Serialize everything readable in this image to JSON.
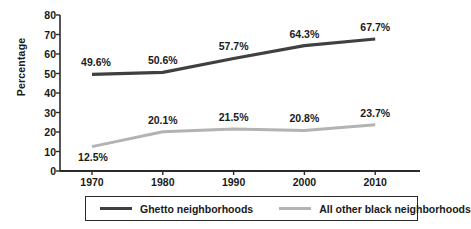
{
  "chart_data": {
    "type": "line",
    "title": "",
    "xlabel": "",
    "ylabel": "Percentage",
    "categories": [
      "1970",
      "1980",
      "1990",
      "2000",
      "2010"
    ],
    "ylim": [
      0,
      80
    ],
    "yticks": [
      "0",
      "10",
      "20",
      "30",
      "40",
      "50",
      "60",
      "70",
      "80"
    ],
    "grid": false,
    "legend_position": "bottom",
    "series": [
      {
        "name": "Ghetto neighborhoods",
        "color": "#404040",
        "values": [
          49.6,
          50.6,
          57.7,
          64.3,
          67.7
        ],
        "labels": [
          "49.6%",
          "50.6%",
          "57.7%",
          "64.3%",
          "67.7%"
        ]
      },
      {
        "name": "All other black neighborhoods",
        "color": "#b3b3b3",
        "values": [
          12.5,
          20.1,
          21.5,
          20.8,
          23.7
        ],
        "labels": [
          "12.5%",
          "20.1%",
          "21.5%",
          "20.8%",
          "23.7%"
        ]
      }
    ]
  },
  "axis": {
    "y_label": "Percentage",
    "y_ticks": [
      "80",
      "70",
      "60",
      "50",
      "40",
      "30",
      "20",
      "10",
      "0"
    ],
    "x_ticks": [
      "1970",
      "1980",
      "1990",
      "2000",
      "2010"
    ]
  },
  "legend": {
    "items": [
      {
        "label": "Ghetto neighborhoods",
        "color": "#404040"
      },
      {
        "label": "All other black neighborhoods",
        "color": "#b3b3b3"
      }
    ]
  }
}
